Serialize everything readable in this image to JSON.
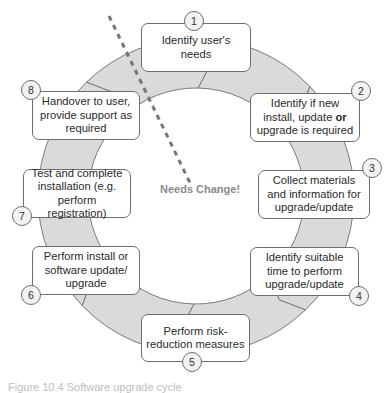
{
  "diagram": {
    "center_label": "Needs Change!",
    "colors": {
      "ring_fill": "#dadada",
      "ring_stroke": "#7a7a7a",
      "dash": "#777777",
      "center_text": "#8a8a8a"
    },
    "steps": [
      {
        "number": "1",
        "text": "Identify user's needs"
      },
      {
        "number": "2",
        "text_before": "Identify if new install, update ",
        "text_bold": "or",
        "text_after": " upgrade is required"
      },
      {
        "number": "3",
        "text": "Collect materials and information for upgrade/update"
      },
      {
        "number": "4",
        "text": "Identify suitable time to perform upgrade/update"
      },
      {
        "number": "5",
        "text": "Perform risk-reduction measures"
      },
      {
        "number": "6",
        "text": "Perform install or software update/ upgrade"
      },
      {
        "number": "7",
        "text": "Test and complete installation (e.g. perform registration)"
      },
      {
        "number": "8",
        "text": "Handover to user, provide support as required"
      }
    ],
    "caption": "Figure 10.4 Software upgrade cycle"
  }
}
